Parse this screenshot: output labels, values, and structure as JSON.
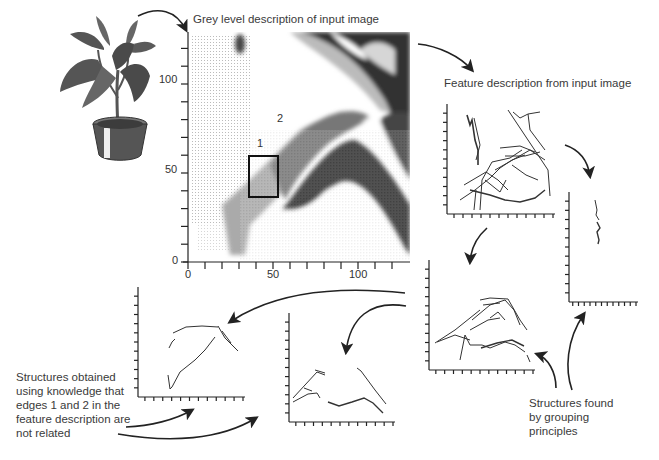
{
  "titles": {
    "grey_level": "Grey level description of input image",
    "feature": "Feature description from input image"
  },
  "annotations": {
    "edge1": "1",
    "edge2": "2",
    "knowledge_lines": [
      "Structures obtained",
      "using knowledge that",
      "edges 1 and 2 in the",
      "feature description are",
      "not related"
    ],
    "grouping_lines": [
      "Structures found",
      "by grouping",
      "principles"
    ]
  },
  "chart_data": [
    {
      "type": "heatmap",
      "title": "Grey level description of input image",
      "xlabel": "",
      "ylabel": "",
      "xlim": [
        0,
        130
      ],
      "ylim": [
        0,
        130
      ],
      "x_ticks": [
        0,
        50,
        100
      ],
      "y_ticks": [
        0,
        50,
        100
      ],
      "minor_tick_step": 10,
      "highlight_box": {
        "x": [
          35,
          52
        ],
        "y": [
          33,
          57
        ]
      },
      "edge_labels": [
        {
          "label": "1",
          "x": 40,
          "y": 62
        },
        {
          "label": "2",
          "x": 59,
          "y": 80
        }
      ]
    },
    {
      "type": "scatter",
      "title": "Feature description from input image",
      "description": "raw edge segments"
    },
    {
      "type": "scatter",
      "title": "",
      "description": "isolated vertical structure"
    },
    {
      "type": "scatter",
      "title": "",
      "description": "grouped edge structures"
    },
    {
      "type": "scatter",
      "title": "",
      "description": "arch structure"
    },
    {
      "type": "scatter",
      "title": "",
      "description": "separated structures"
    }
  ]
}
